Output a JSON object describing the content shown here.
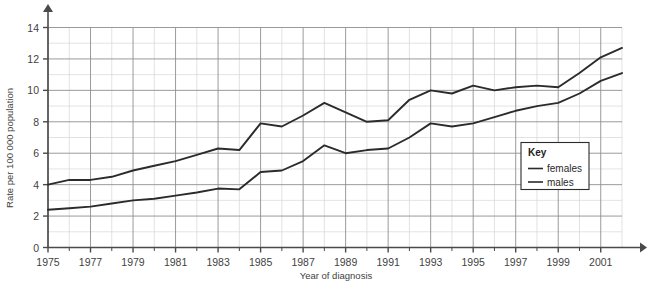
{
  "chart_data": {
    "type": "line",
    "title": "",
    "xlabel": "Year of diagnosis",
    "ylabel": "Rate per 100 000 population",
    "xlim": [
      1975,
      2002
    ],
    "ylim": [
      0,
      14
    ],
    "grid": true,
    "grid_major_y_step": 2,
    "grid_minor_y_step": 1,
    "grid_major_x_step": 2,
    "grid_minor_x_step": 1,
    "x_tick_labels": [
      "1975",
      "1977",
      "1979",
      "1981",
      "1983",
      "1985",
      "1987",
      "1989",
      "1991",
      "1993",
      "1995",
      "1997",
      "1999",
      "2001"
    ],
    "y_tick_labels": [
      "0",
      "2",
      "4",
      "6",
      "8",
      "10",
      "12",
      "14"
    ],
    "legend_position": "inside-right",
    "legend_title": "Key",
    "x": [
      1975,
      1976,
      1977,
      1978,
      1979,
      1980,
      1981,
      1982,
      1983,
      1984,
      1985,
      1986,
      1987,
      1988,
      1989,
      1990,
      1991,
      1992,
      1993,
      1994,
      1995,
      1996,
      1997,
      1998,
      1999,
      2000,
      2001,
      2002
    ],
    "series": [
      {
        "name": "females",
        "color": "#2b2b2b",
        "values": [
          4.0,
          4.3,
          4.3,
          4.5,
          4.9,
          5.2,
          5.5,
          5.9,
          6.3,
          6.2,
          7.9,
          7.7,
          8.4,
          9.2,
          8.6,
          8.0,
          8.1,
          9.4,
          10.0,
          9.8,
          10.3,
          10.0,
          10.2,
          10.3,
          10.2,
          11.1,
          12.1,
          12.7
        ]
      },
      {
        "name": "males",
        "color": "#2b2b2b",
        "values": [
          2.4,
          2.5,
          2.6,
          2.8,
          3.0,
          3.1,
          3.3,
          3.5,
          3.75,
          3.7,
          4.8,
          4.9,
          5.5,
          6.5,
          6.0,
          6.2,
          6.3,
          7.0,
          7.9,
          7.7,
          7.9,
          8.3,
          8.7,
          9.0,
          9.2,
          9.8,
          10.6,
          11.1
        ]
      }
    ]
  },
  "axes": {
    "y_axis_title": "Rate per 100 000 population",
    "x_axis_title": "Year of diagnosis"
  },
  "legend": {
    "title": "Key",
    "entries": [
      {
        "label": "females"
      },
      {
        "label": "males"
      }
    ]
  },
  "colors": {
    "line": "#2b2b2b",
    "axis": "#4a4a4a",
    "grid_major": "#8e8e8e",
    "grid_minor": "#d6d6d6",
    "text": "#3f3f3f"
  }
}
